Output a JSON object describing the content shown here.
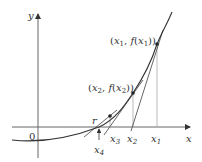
{
  "diagram": {
    "axes": {
      "x_label": "x",
      "y_label": "y",
      "origin_label": "0"
    },
    "points": [
      {
        "id": "p1",
        "label_var": "x",
        "label_sub": "1",
        "label_fn": "f",
        "text": "(x1, f(x1))"
      },
      {
        "id": "p2",
        "label_var": "x",
        "label_sub": "2",
        "label_fn": "f",
        "text": "(x2, f(x2))"
      }
    ],
    "x_ticks": [
      {
        "var": "x",
        "sub": "1"
      },
      {
        "var": "x",
        "sub": "2"
      },
      {
        "var": "x",
        "sub": "3"
      },
      {
        "var": "x",
        "sub": "4"
      }
    ],
    "root_label": "r",
    "colors": {
      "curve": "#333333",
      "axes": "#444444",
      "tangents": "#555555",
      "verticals": "#999999"
    }
  }
}
